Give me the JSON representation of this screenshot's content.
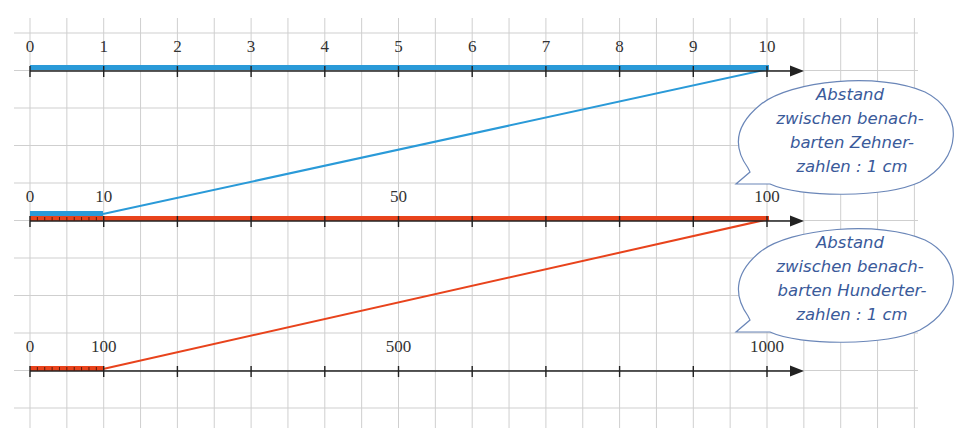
{
  "colors": {
    "grid": "#c8c8c8",
    "axis": "#222222",
    "blue": "#2a9ad8",
    "orange": "#e8431c",
    "bubble_text": "#3a5a9a",
    "bubble_outline": "#5a7ab0"
  },
  "number_lines": [
    {
      "id": "line-0-10",
      "labels": [
        {
          "value": "0",
          "unit": 0
        },
        {
          "value": "1",
          "unit": 1
        },
        {
          "value": "2",
          "unit": 2
        },
        {
          "value": "3",
          "unit": 3
        },
        {
          "value": "4",
          "unit": 4
        },
        {
          "value": "5",
          "unit": 5
        },
        {
          "value": "6",
          "unit": 6
        },
        {
          "value": "7",
          "unit": 7
        },
        {
          "value": "8",
          "unit": 8
        },
        {
          "value": "9",
          "unit": 9
        },
        {
          "value": "10",
          "unit": 10
        }
      ],
      "highlight": "blue full 0-10"
    },
    {
      "id": "line-0-100",
      "labels": [
        {
          "value": "0",
          "unit": 0
        },
        {
          "value": "10",
          "unit": 1
        },
        {
          "value": "50",
          "unit": 5
        },
        {
          "value": "100",
          "unit": 10
        }
      ],
      "highlight": "blue 0-10 segment, orange full 0-100"
    },
    {
      "id": "line-0-1000",
      "labels": [
        {
          "value": "0",
          "unit": 0
        },
        {
          "value": "100",
          "unit": 1
        },
        {
          "value": "500",
          "unit": 5
        },
        {
          "value": "1000",
          "unit": 10
        }
      ],
      "highlight": "orange 0-100 segment"
    }
  ],
  "bubbles": [
    {
      "id": "bubble-zehner",
      "lines": [
        "Abstand",
        "zwischen benach-",
        "barten Zehner-",
        "zahlen : 1 cm"
      ]
    },
    {
      "id": "bubble-hunderter",
      "lines": [
        "Abstand",
        "zwischen benach-",
        "barten Hunderter-",
        "zahlen : 1 cm"
      ]
    }
  ]
}
